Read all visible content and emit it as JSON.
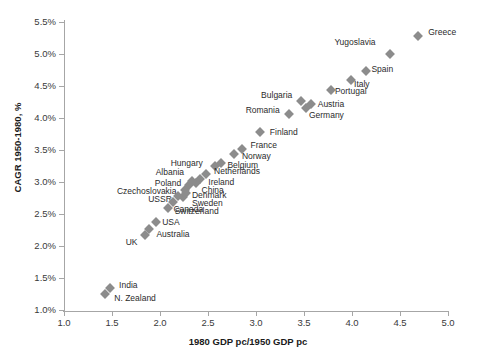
{
  "chart_data": {
    "type": "scatter",
    "title": "",
    "xlabel": "1980 GDP pc/1950 GDP pc",
    "ylabel": "CAGR 1950-1980, %",
    "xlim": [
      1.0,
      5.0
    ],
    "ylim": [
      1.0,
      5.5
    ],
    "xticks": [
      "1.0",
      "1.5",
      "2.0",
      "2.5",
      "3.0",
      "3.5",
      "4.0",
      "4.5",
      "5.0"
    ],
    "yticks": [
      "1.0%",
      "1.5%",
      "2.0%",
      "2.5%",
      "3.0%",
      "3.5%",
      "4.0%",
      "4.5%",
      "5.0%",
      "5.5%"
    ],
    "grid": false,
    "legend": "none",
    "marker_color": "#8c8c8c",
    "axis_color": "#a6a6a6",
    "points": [
      {
        "label": "Greece",
        "x": 4.69,
        "y": 5.28,
        "lx": 10,
        "ly": -4
      },
      {
        "label": "Yugoslavia",
        "x": 4.4,
        "y": 5.0,
        "lx": -56,
        "ly": -12
      },
      {
        "label": "Spain",
        "x": 4.15,
        "y": 4.73,
        "lx": 5,
        "ly": -2
      },
      {
        "label": "Italy",
        "x": 3.99,
        "y": 4.59,
        "lx": 3,
        "ly": 4
      },
      {
        "label": "Portugal",
        "x": 3.78,
        "y": 4.43,
        "lx": 4,
        "ly": 1
      },
      {
        "label": "Austria",
        "x": 3.57,
        "y": 4.22,
        "lx": 7,
        "ly": 0
      },
      {
        "label": "Germany",
        "x": 3.52,
        "y": 4.16,
        "lx": 3,
        "ly": 7
      },
      {
        "label": "Bulgaria",
        "x": 3.47,
        "y": 4.27,
        "lx": -40,
        "ly": -6
      },
      {
        "label": "Romania",
        "x": 3.34,
        "y": 4.06,
        "lx": -43,
        "ly": -4
      },
      {
        "label": "Finland",
        "x": 3.04,
        "y": 3.78,
        "lx": 10,
        "ly": 0
      },
      {
        "label": "France",
        "x": 2.85,
        "y": 3.52,
        "lx": 9,
        "ly": -4
      },
      {
        "label": "Norway",
        "x": 2.77,
        "y": 3.44,
        "lx": 8,
        "ly": 2
      },
      {
        "label": "Belgium",
        "x": 2.64,
        "y": 3.3,
        "lx": 6,
        "ly": 2
      },
      {
        "label": "Hungary",
        "x": 2.57,
        "y": 3.25,
        "lx": -44,
        "ly": -3
      },
      {
        "label": "Netherlands",
        "x": 2.48,
        "y": 3.12,
        "lx": 8,
        "ly": -3
      },
      {
        "label": "Ireland",
        "x": 2.42,
        "y": 3.05,
        "lx": 8,
        "ly": 3
      },
      {
        "label": "China",
        "x": 2.37,
        "y": 2.98,
        "lx": 6,
        "ly": 7
      },
      {
        "label": "Albania",
        "x": 2.33,
        "y": 3.02,
        "lx": -36,
        "ly": -9
      },
      {
        "label": "Poland",
        "x": 2.3,
        "y": 2.95,
        "lx": -34,
        "ly": -2
      },
      {
        "label": "Czechoslovakia",
        "x": 2.26,
        "y": 2.88,
        "lx": -68,
        "ly": 1
      },
      {
        "label": "Denmark",
        "x": 2.27,
        "y": 2.83,
        "lx": 6,
        "ly": 2
      },
      {
        "label": "Sweden",
        "x": 2.24,
        "y": 2.76,
        "lx": 9,
        "ly": 6
      },
      {
        "label": "USSR",
        "x": 2.19,
        "y": 2.78,
        "lx": -30,
        "ly": 3
      },
      {
        "label": "Canada",
        "x": 2.14,
        "y": 2.68,
        "lx": 0,
        "ly": 7
      },
      {
        "label": "Switzerland",
        "x": 2.08,
        "y": 2.59,
        "lx": 7,
        "ly": 3
      },
      {
        "label": "USA",
        "x": 1.96,
        "y": 2.38,
        "lx": 6,
        "ly": 0
      },
      {
        "label": "Australia",
        "x": 1.89,
        "y": 2.27,
        "lx": 7,
        "ly": 5
      },
      {
        "label": "UK",
        "x": 1.84,
        "y": 2.17,
        "lx": -19,
        "ly": 7
      },
      {
        "label": "India",
        "x": 1.48,
        "y": 1.35,
        "lx": 9,
        "ly": -3
      },
      {
        "label": "N. Zealand",
        "x": 1.43,
        "y": 1.25,
        "lx": 9,
        "ly": 4
      }
    ]
  }
}
